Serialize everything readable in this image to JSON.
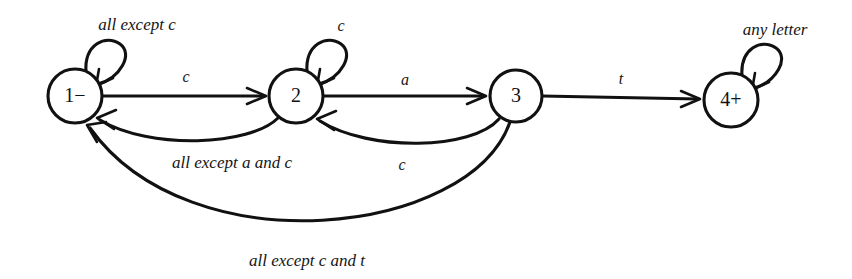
{
  "figure": {
    "kind": "finite-state-machine-diagram",
    "background_color": "#ffffff",
    "ink_color": "#111111",
    "width": 852,
    "height": 279
  },
  "states": [
    {
      "id": "1",
      "label": "1−",
      "marker": "−",
      "kind": "rejecting-start",
      "cx": 75,
      "cy": 96,
      "r": 27
    },
    {
      "id": "2",
      "label": "2",
      "marker": "",
      "kind": "rejecting",
      "cx": 296,
      "cy": 96,
      "r": 27
    },
    {
      "id": "3",
      "label": "3",
      "marker": "",
      "kind": "rejecting",
      "cx": 516,
      "cy": 96,
      "r": 26
    },
    {
      "id": "4",
      "label": "4+",
      "marker": "+",
      "kind": "accepting",
      "cx": 731,
      "cy": 100,
      "r": 27
    }
  ],
  "self_loops": [
    {
      "id": "loop-1",
      "state": "1",
      "label": "all except c",
      "label_x": 137,
      "label_y": 26
    },
    {
      "id": "loop-2",
      "state": "2",
      "label": "c",
      "label_x": 341,
      "label_y": 27
    },
    {
      "id": "loop-4",
      "state": "4",
      "label": "any letter",
      "label_x": 775,
      "label_y": 31
    }
  ],
  "transitions": [
    {
      "id": "t-1-2",
      "from": "1",
      "to": "2",
      "label": "c",
      "label_x": 186,
      "label_y": 78,
      "shape": "straight"
    },
    {
      "id": "t-2-3",
      "from": "2",
      "to": "3",
      "label": "a",
      "label_x": 405,
      "label_y": 81,
      "shape": "straight"
    },
    {
      "id": "t-3-4",
      "from": "3",
      "to": "4",
      "label": "t",
      "label_x": 621,
      "label_y": 80,
      "shape": "straight"
    },
    {
      "id": "t-2-1",
      "from": "2",
      "to": "1",
      "label": "all except a and c",
      "label_x": 232,
      "label_y": 164,
      "shape": "arc-below-short"
    },
    {
      "id": "t-3-2",
      "from": "3",
      "to": "2",
      "label": "c",
      "label_x": 402,
      "label_y": 166,
      "shape": "arc-below-short"
    },
    {
      "id": "t-3-1",
      "from": "3",
      "to": "1",
      "label": "all except c and t",
      "label_x": 307,
      "label_y": 262,
      "shape": "arc-below-long"
    }
  ]
}
